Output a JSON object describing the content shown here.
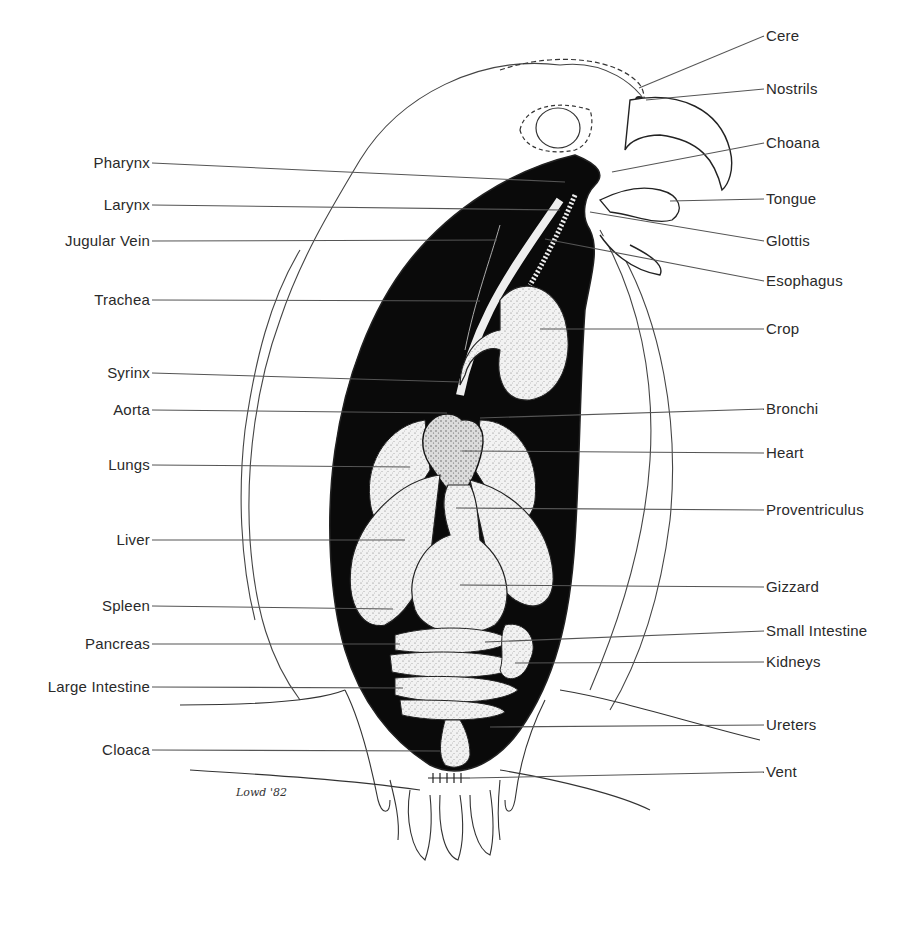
{
  "diagram": {
    "signature": "Lowd '82",
    "labels_left": [
      {
        "id": "pharynx",
        "text": "Pharynx",
        "label_y": 163,
        "line_end": [
          565,
          182
        ]
      },
      {
        "id": "larynx",
        "text": "Larynx",
        "label_y": 205,
        "line_end": [
          560,
          210
        ]
      },
      {
        "id": "jugular-vein",
        "text": "Jugular Vein",
        "label_y": 241,
        "line_end": [
          497,
          240
        ]
      },
      {
        "id": "trachea",
        "text": "Trachea",
        "label_y": 300,
        "line_end": [
          480,
          301
        ]
      },
      {
        "id": "syrinx",
        "text": "Syrinx",
        "label_y": 373,
        "line_end": [
          460,
          382
        ]
      },
      {
        "id": "aorta",
        "text": "Aorta",
        "label_y": 410,
        "line_end": [
          447,
          413
        ]
      },
      {
        "id": "lungs",
        "text": "Lungs",
        "label_y": 465,
        "line_end": [
          410,
          467
        ]
      },
      {
        "id": "liver",
        "text": "Liver",
        "label_y": 540,
        "line_end": [
          405,
          540
        ]
      },
      {
        "id": "spleen",
        "text": "Spleen",
        "label_y": 606,
        "line_end": [
          393,
          609
        ]
      },
      {
        "id": "pancreas",
        "text": "Pancreas",
        "label_y": 644,
        "line_end": [
          400,
          644
        ]
      },
      {
        "id": "large-intestine",
        "text": "Large Intestine",
        "label_y": 687,
        "line_end": [
          403,
          688
        ]
      },
      {
        "id": "cloaca",
        "text": "Cloaca",
        "label_y": 750,
        "line_end": [
          440,
          751
        ]
      }
    ],
    "labels_right": [
      {
        "id": "cere",
        "text": "Cere",
        "label_y": 36,
        "line_start": [
          639,
          88
        ]
      },
      {
        "id": "nostrils",
        "text": "Nostrils",
        "label_y": 89,
        "line_start": [
          646,
          100
        ]
      },
      {
        "id": "choana",
        "text": "Choana",
        "label_y": 143,
        "line_start": [
          612,
          172
        ]
      },
      {
        "id": "tongue",
        "text": "Tongue",
        "label_y": 199,
        "line_start": [
          670,
          201
        ]
      },
      {
        "id": "glottis",
        "text": "Glottis",
        "label_y": 241,
        "line_start": [
          590,
          212
        ]
      },
      {
        "id": "esophagus",
        "text": "Esophagus",
        "label_y": 281,
        "line_start": [
          545,
          239
        ]
      },
      {
        "id": "crop",
        "text": "Crop",
        "label_y": 329,
        "line_start": [
          540,
          329
        ]
      },
      {
        "id": "bronchi",
        "text": "Bronchi",
        "label_y": 409,
        "line_start": [
          480,
          418
        ]
      },
      {
        "id": "heart",
        "text": "Heart",
        "label_y": 453,
        "line_start": [
          462,
          451
        ]
      },
      {
        "id": "proventriculus",
        "text": "Proventriculus",
        "label_y": 510,
        "line_start": [
          456,
          508
        ]
      },
      {
        "id": "gizzard",
        "text": "Gizzard",
        "label_y": 587,
        "line_start": [
          460,
          585
        ]
      },
      {
        "id": "small-intestine",
        "text": "Small Intestine",
        "label_y": 631,
        "line_start": [
          485,
          642
        ]
      },
      {
        "id": "kidneys",
        "text": "Kidneys",
        "label_y": 662,
        "line_start": [
          515,
          663
        ]
      },
      {
        "id": "ureters",
        "text": "Ureters",
        "label_y": 725,
        "line_start": [
          490,
          727
        ]
      },
      {
        "id": "vent",
        "text": "Vent",
        "label_y": 772,
        "line_start": [
          470,
          778
        ]
      }
    ],
    "colors": {
      "ink": "#1a1a1a",
      "body_cavity": "#0a0a0a",
      "organ_fill": "#e9e9e9",
      "background": "#ffffff",
      "label_text": "#2a2a2a"
    }
  }
}
